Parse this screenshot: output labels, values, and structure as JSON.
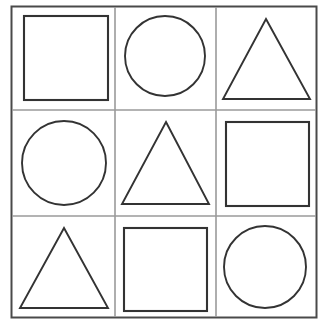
{
  "document": {
    "title": "Shapes Grid Worksheet",
    "background_color": "#ffffff",
    "width": 331,
    "height": 336
  },
  "grid": {
    "rows": 3,
    "columns": 3,
    "outer_border": {
      "x": 11.5,
      "y": 6.5,
      "width": 305,
      "height": 311,
      "stroke_color": "#4a4a4a",
      "stroke_width": 2
    },
    "divider_color": "#9a9a9a",
    "vertical_divider_x": [
      115,
      216
    ],
    "horizontal_divider_y": [
      110,
      216
    ]
  },
  "shapes": {
    "stroke_color": "#333333",
    "fill": "none",
    "items": [
      {
        "name": "square",
        "row": 0,
        "column": 0,
        "cell": "top-left",
        "type": "square",
        "x": 24,
        "y": 16,
        "width": 84,
        "height": 84
      },
      {
        "name": "circle",
        "row": 0,
        "column": 1,
        "cell": "top-center",
        "type": "circle",
        "cx": 165,
        "cy": 56,
        "r": 40
      },
      {
        "name": "triangle",
        "row": 0,
        "column": 2,
        "cell": "top-right",
        "type": "triangle",
        "apex_x": 266,
        "apex_y": 19,
        "base_left_x": 223,
        "base_right_x": 310,
        "base_y": 99
      },
      {
        "name": "circle",
        "row": 1,
        "column": 0,
        "cell": "middle-left",
        "type": "circle",
        "cx": 64,
        "cy": 163,
        "r": 42
      },
      {
        "name": "triangle",
        "row": 1,
        "column": 1,
        "cell": "middle-center",
        "type": "triangle",
        "apex_x": 166,
        "apex_y": 122,
        "base_left_x": 122,
        "base_right_x": 209,
        "base_y": 204
      },
      {
        "name": "square",
        "row": 1,
        "column": 2,
        "cell": "middle-right",
        "type": "square",
        "x": 226,
        "y": 122,
        "width": 83,
        "height": 84
      },
      {
        "name": "triangle",
        "row": 2,
        "column": 0,
        "cell": "bottom-left",
        "type": "triangle",
        "apex_x": 64,
        "apex_y": 228,
        "base_left_x": 20,
        "base_right_x": 108,
        "base_y": 308
      },
      {
        "name": "square",
        "row": 2,
        "column": 1,
        "cell": "bottom-center",
        "type": "square",
        "x": 124,
        "y": 228,
        "width": 83,
        "height": 83
      },
      {
        "name": "circle",
        "row": 2,
        "column": 2,
        "cell": "bottom-right",
        "type": "circle",
        "cx": 265,
        "cy": 267,
        "r": 41
      }
    ]
  }
}
